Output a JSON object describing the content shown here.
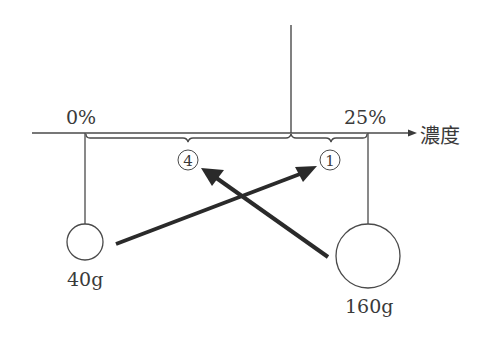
{
  "diagram": {
    "axis": {
      "label": "濃度",
      "ticks": [
        {
          "label": "0%",
          "position": "left"
        },
        {
          "label": "25%",
          "position": "right"
        }
      ]
    },
    "braces": [
      {
        "id": "left-segment",
        "marker": "④"
      },
      {
        "id": "right-segment",
        "marker": "①"
      }
    ],
    "weights": [
      {
        "label": "40g",
        "concentration": "0%"
      },
      {
        "label": "160g",
        "concentration": "25%"
      }
    ],
    "arrows": [
      {
        "from": "40g",
        "to": "①"
      },
      {
        "from": "160g",
        "to": "④"
      }
    ],
    "colors": {
      "line": "#4a4a4a",
      "arrow": "#2a2a2a",
      "text": "#3a3a3a"
    }
  }
}
